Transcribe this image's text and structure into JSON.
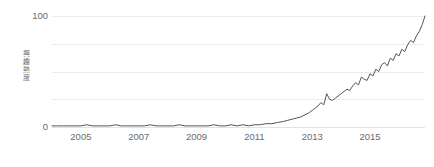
{
  "chart_data": {
    "type": "line",
    "title": "",
    "subtitle": "",
    "xlabel": "",
    "ylabel": "興趣熱度",
    "ylim": [
      0,
      100
    ],
    "xlim": [
      2004.0,
      2016.9
    ],
    "yticks": [
      0,
      100
    ],
    "ytick_labels": [
      "0",
      "100"
    ],
    "gridlines": [
      0,
      25,
      50,
      75,
      100
    ],
    "grid": true,
    "legend": "none",
    "xticks": [
      2005,
      2007,
      2009,
      2011,
      2013,
      2015
    ],
    "xtick_labels": [
      "2005",
      "2007",
      "2009",
      "2011",
      "2013",
      "2015"
    ],
    "line_color": "#555555",
    "grid_color": "#ebebeb",
    "text_color": "#6b6b6b",
    "series": [
      {
        "name": "興趣熱度",
        "x": [
          2004.0,
          2004.2,
          2004.4,
          2004.6,
          2004.8,
          2005.0,
          2005.2,
          2005.4,
          2005.6,
          2005.8,
          2006.0,
          2006.2,
          2006.4,
          2006.6,
          2006.8,
          2007.0,
          2007.2,
          2007.4,
          2007.6,
          2007.8,
          2008.0,
          2008.2,
          2008.4,
          2008.6,
          2008.8,
          2009.0,
          2009.2,
          2009.4,
          2009.6,
          2009.8,
          2010.0,
          2010.2,
          2010.4,
          2010.6,
          2010.8,
          2011.0,
          2011.2,
          2011.4,
          2011.6,
          2011.8,
          2012.0,
          2012.15,
          2012.3,
          2012.45,
          2012.6,
          2012.75,
          2012.9,
          2013.0,
          2013.1,
          2013.2,
          2013.3,
          2013.4,
          2013.5,
          2013.6,
          2013.7,
          2013.8,
          2013.9,
          2014.0,
          2014.1,
          2014.2,
          2014.3,
          2014.4,
          2014.5,
          2014.6,
          2014.7,
          2014.8,
          2014.9,
          2015.0,
          2015.1,
          2015.2,
          2015.3,
          2015.4,
          2015.5,
          2015.6,
          2015.7,
          2015.8,
          2015.9,
          2016.0,
          2016.1,
          2016.2,
          2016.3,
          2016.4,
          2016.5,
          2016.6,
          2016.7,
          2016.8,
          2016.9
        ],
        "values": [
          1,
          1,
          1,
          1,
          1,
          1,
          2,
          1,
          1,
          1,
          1,
          2,
          1,
          1,
          1,
          1,
          1,
          2,
          1,
          1,
          1,
          1,
          2,
          1,
          1,
          1,
          1,
          1,
          2,
          1,
          1,
          2,
          1,
          2,
          1,
          2,
          2,
          3,
          3,
          4,
          5,
          6,
          7,
          8,
          9,
          11,
          13,
          15,
          17,
          19,
          22,
          20,
          30,
          25,
          24,
          26,
          28,
          30,
          32,
          34,
          33,
          37,
          40,
          38,
          45,
          43,
          42,
          48,
          46,
          52,
          50,
          56,
          58,
          55,
          62,
          60,
          66,
          64,
          70,
          68,
          74,
          78,
          76,
          82,
          86,
          92,
          100
        ]
      }
    ]
  },
  "axis": {
    "y_top_label": "100",
    "y_bottom_label": "0",
    "y_title": "興趣熱度"
  }
}
